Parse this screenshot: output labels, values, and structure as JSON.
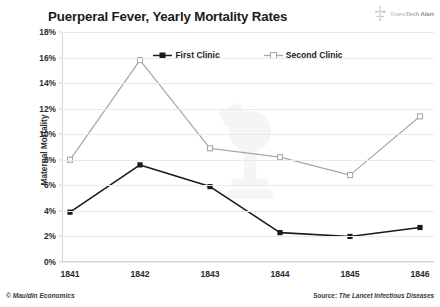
{
  "header": {
    "title": "Puerperal Fever, Yearly Mortality Rates",
    "brand": {
      "icon": "transtech-logo-icon",
      "part1": "Trans",
      "part2": "Tech",
      "part3": "Alert"
    }
  },
  "footer": {
    "copyright": "© Mauldin Economics",
    "source_prefix": "Source: ",
    "source_journal": "The Lancet Infectious Diseases"
  },
  "watermark": {
    "name": "microscope-watermark"
  },
  "chart_data": {
    "type": "line",
    "title": "Puerperal Fever, Yearly Mortality Rates",
    "xlabel": "",
    "ylabel": "Maternal Mortality",
    "categories": [
      "1841",
      "1842",
      "1843",
      "1844",
      "1845",
      "1846"
    ],
    "series": [
      {
        "name": "First Clinic",
        "color": "#1a1a1a",
        "marker": "filled-square",
        "values": [
          3.9,
          7.6,
          5.9,
          2.3,
          2.0,
          2.7
        ]
      },
      {
        "name": "Second Clinic",
        "color": "#a8a8a8",
        "marker": "open-square",
        "values": [
          8.0,
          15.8,
          8.9,
          8.2,
          6.8,
          11.4
        ]
      }
    ],
    "ylim": [
      0,
      18
    ],
    "ytick_values": [
      0,
      2,
      4,
      6,
      8,
      10,
      12,
      14,
      16,
      18
    ],
    "ytick_labels": [
      "0%",
      "2%",
      "4%",
      "6%",
      "8%",
      "10%",
      "12%",
      "14%",
      "16%",
      "18%"
    ],
    "grid": true,
    "legend_position": "top-center"
  }
}
